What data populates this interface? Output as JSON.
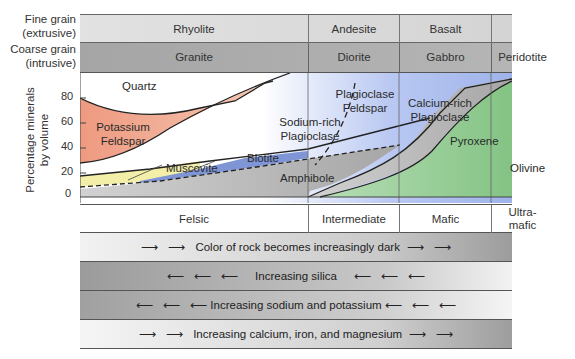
{
  "rows": {
    "fine": {
      "label_line1": "Fine grain",
      "label_line2": "(extrusive)"
    },
    "coarse": {
      "label_line1": "Coarse grain",
      "label_line2": "(intrusive)"
    }
  },
  "extrusive": [
    "Rhyolite",
    "Andesite",
    "Basalt",
    ""
  ],
  "intrusive": [
    "Granite",
    "Diorite",
    "Gabbro",
    "Peridotite"
  ],
  "y_axis": {
    "label_line1": "Percentage minerals",
    "label_line2": "by volume",
    "ticks": [
      "80",
      "60",
      "40",
      "20",
      "0"
    ]
  },
  "minerals": {
    "quartz": "Quartz",
    "kfeldspar_1": "Potassium",
    "kfeldspar_2": "Feldspar",
    "muscovite": "Muscovite",
    "biotite": "Biotite",
    "na_plag_1": "Sodium-rich",
    "na_plag_2": "Plagioclase",
    "plag_1": "Plagioclase",
    "plag_2": "Feldspar",
    "ca_plag_1": "Calcium-rich",
    "ca_plag_2": "Plagioclase",
    "amphibole": "Amphibole",
    "pyroxene": "Pyroxene",
    "olivine": "Olivine"
  },
  "composition": {
    "felsic": "Felsic",
    "intermediate": "Intermediate",
    "mafic": "Mafic",
    "ultramafic_1": "Ultra-",
    "ultramafic_2": "mafic"
  },
  "trends": [
    {
      "text": "Color of rock becomes increasingly dark",
      "direction": "right"
    },
    {
      "text": "Increasing silica",
      "direction": "left"
    },
    {
      "text": "Increasing sodium and potassium",
      "direction": "left"
    },
    {
      "text": "Increasing calcium, iron, and magnesium",
      "direction": "right"
    }
  ],
  "arrows": {
    "right": "⟶",
    "left": "⟵"
  },
  "colors": {
    "fine_row": "#dcdcdc",
    "coarse_row": "#a9a9a9",
    "k_feldspar": "#f0a88e",
    "muscovite": "#f3eea8",
    "biotite": "#7f95d6",
    "plagioclase_blue": "#aebeee",
    "amphibole_gray": "#b4b4b4",
    "olivine": "#8ec98e"
  }
}
